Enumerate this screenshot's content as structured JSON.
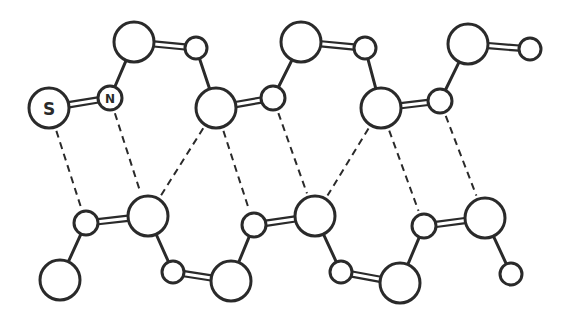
{
  "diagram": {
    "title": "",
    "labels": {
      "sulfur": "S",
      "nitrogen": "N"
    },
    "colors": {
      "stroke": "#2a2a2a",
      "fill": "#ffffff",
      "background": "#ffffff"
    },
    "atoms": [
      {
        "id": "S",
        "x": 49,
        "y": 108,
        "r": 20,
        "label": "S"
      },
      {
        "id": "N",
        "x": 110,
        "y": 98,
        "r": 12,
        "label": "N"
      },
      {
        "id": "t1",
        "x": 134,
        "y": 42,
        "r": 20
      },
      {
        "id": "t2",
        "x": 196,
        "y": 48,
        "r": 11
      },
      {
        "id": "t3",
        "x": 216,
        "y": 108,
        "r": 20
      },
      {
        "id": "t4",
        "x": 273,
        "y": 98,
        "r": 12
      },
      {
        "id": "t5",
        "x": 301,
        "y": 42,
        "r": 20
      },
      {
        "id": "t6",
        "x": 365,
        "y": 48,
        "r": 11
      },
      {
        "id": "t7",
        "x": 381,
        "y": 108,
        "r": 20
      },
      {
        "id": "t8",
        "x": 440,
        "y": 101,
        "r": 12
      },
      {
        "id": "t9",
        "x": 468,
        "y": 44,
        "r": 20
      },
      {
        "id": "t10",
        "x": 530,
        "y": 49,
        "r": 11
      },
      {
        "id": "b0",
        "x": 60,
        "y": 280,
        "r": 20
      },
      {
        "id": "b1",
        "x": 86,
        "y": 223,
        "r": 12
      },
      {
        "id": "b2",
        "x": 148,
        "y": 216,
        "r": 20
      },
      {
        "id": "b3",
        "x": 173,
        "y": 272,
        "r": 11
      },
      {
        "id": "b4",
        "x": 231,
        "y": 281,
        "r": 20
      },
      {
        "id": "b5",
        "x": 254,
        "y": 225,
        "r": 12
      },
      {
        "id": "b6",
        "x": 315,
        "y": 216,
        "r": 20
      },
      {
        "id": "b7",
        "x": 341,
        "y": 272,
        "r": 11
      },
      {
        "id": "b8",
        "x": 400,
        "y": 283,
        "r": 20
      },
      {
        "id": "b9",
        "x": 424,
        "y": 226,
        "r": 12
      },
      {
        "id": "b10",
        "x": 485,
        "y": 218,
        "r": 20
      },
      {
        "id": "b11",
        "x": 511,
        "y": 274,
        "r": 11
      }
    ],
    "single_bonds": [
      [
        "N",
        "t1"
      ],
      [
        "t2",
        "t3"
      ],
      [
        "t4",
        "t5"
      ],
      [
        "t6",
        "t7"
      ],
      [
        "t8",
        "t9"
      ],
      [
        "b0",
        "b1"
      ],
      [
        "b2",
        "b3"
      ],
      [
        "b4",
        "b5"
      ],
      [
        "b6",
        "b7"
      ],
      [
        "b8",
        "b9"
      ],
      [
        "b10",
        "b11"
      ]
    ],
    "double_bonds": [
      [
        "S",
        "N"
      ],
      [
        "t1",
        "t2"
      ],
      [
        "t3",
        "t4"
      ],
      [
        "t5",
        "t6"
      ],
      [
        "t7",
        "t8"
      ],
      [
        "t9",
        "t10"
      ],
      [
        "b1",
        "b2"
      ],
      [
        "b3",
        "b4"
      ],
      [
        "b5",
        "b6"
      ],
      [
        "b7",
        "b8"
      ],
      [
        "b9",
        "b10"
      ]
    ],
    "hydrogen_bonds": [
      [
        "S",
        "b1"
      ],
      [
        "N",
        "b2"
      ],
      [
        "t3",
        "b2"
      ],
      [
        "t3",
        "b5"
      ],
      [
        "t4",
        "b6"
      ],
      [
        "t7",
        "b6"
      ],
      [
        "t7",
        "b9"
      ],
      [
        "t8",
        "b10"
      ]
    ]
  }
}
